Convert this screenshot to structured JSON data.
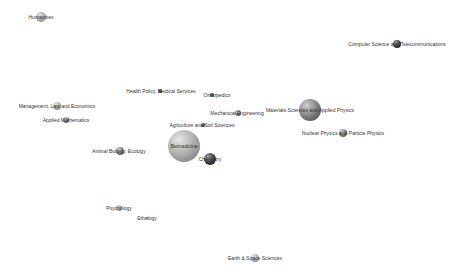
{
  "diagram": {
    "type": "bubble-network-map",
    "background": "#ffffff",
    "nodes": [
      {
        "id": "humanities",
        "label": "Humanities",
        "x": 41,
        "y": 17,
        "r": 5,
        "shade": "light",
        "label_x": 41,
        "label_y": 17
      },
      {
        "id": "computer-science",
        "label": "Computer Science and Telecommunications",
        "x": 397,
        "y": 44,
        "r": 4,
        "shade": "dark",
        "label_x": 397,
        "label_y": 44
      },
      {
        "id": "health-policy",
        "label": "Health Policy, Medical Services",
        "x": 160,
        "y": 91,
        "r": 2,
        "shade": "dark",
        "label_x": 161,
        "label_y": 91
      },
      {
        "id": "orthopedics",
        "label": "Orthopedics",
        "x": 212,
        "y": 95,
        "r": 2,
        "shade": "dark",
        "label_x": 217,
        "label_y": 95
      },
      {
        "id": "management",
        "label": "Management, Law and Economics",
        "x": 57,
        "y": 106,
        "r": 4,
        "shade": "light",
        "label_x": 57,
        "label_y": 106
      },
      {
        "id": "materials-sciences",
        "label": "Materials Sciences and Applied Physics",
        "x": 310,
        "y": 110,
        "r": 11,
        "shade": "mid",
        "label_x": 310,
        "label_y": 110
      },
      {
        "id": "mechanical-engineering",
        "label": "Mechanical Engineering",
        "x": 238,
        "y": 113,
        "r": 3,
        "shade": "mid",
        "label_x": 237,
        "label_y": 113
      },
      {
        "id": "applied-mathematics",
        "label": "Applied Mathematics",
        "x": 66,
        "y": 120,
        "r": 3,
        "shade": "mid",
        "label_x": 66,
        "label_y": 120
      },
      {
        "id": "agriculture",
        "label": "Agriculture and Soil Sciences",
        "x": 203,
        "y": 125,
        "r": 2,
        "shade": "dark",
        "label_x": 202,
        "label_y": 125
      },
      {
        "id": "nuclear-physics",
        "label": "Nuclear Physics and Particle Physics",
        "x": 343,
        "y": 133,
        "r": 4,
        "shade": "mid",
        "label_x": 343,
        "label_y": 133
      },
      {
        "id": "biomedicine",
        "label": "Biomedicine",
        "x": 184,
        "y": 146,
        "r": 16,
        "shade": "light",
        "label_x": 184,
        "label_y": 146
      },
      {
        "id": "animal-biology",
        "label": "Animal Biology, Ecology",
        "x": 120,
        "y": 151,
        "r": 4,
        "shade": "mid",
        "label_x": 119,
        "label_y": 151
      },
      {
        "id": "chemistry",
        "label": "Chemistry",
        "x": 210,
        "y": 159,
        "r": 6,
        "shade": "dark",
        "label_x": 210,
        "label_y": 159
      },
      {
        "id": "psychology",
        "label": "Psychology",
        "x": 119,
        "y": 208,
        "r": 3,
        "shade": "light",
        "label_x": 119,
        "label_y": 208
      },
      {
        "id": "ethology",
        "label": "Ethology",
        "x": 147,
        "y": 218,
        "r": 1,
        "shade": "mid",
        "label_x": 147,
        "label_y": 218
      },
      {
        "id": "earth-space",
        "label": "Earth & Space Sciences",
        "x": 255,
        "y": 258,
        "r": 4,
        "shade": "light",
        "label_x": 255,
        "label_y": 258
      }
    ],
    "shades": {
      "light": {
        "highlight": "#e6e6e6",
        "base": "#a8a8a8",
        "edge": "#6e6e6e"
      },
      "mid": {
        "highlight": "#cfcfcf",
        "base": "#7a7a7a",
        "edge": "#3f3f3f"
      },
      "dark": {
        "highlight": "#9a9a9a",
        "base": "#3a3a3a",
        "edge": "#111111"
      }
    },
    "label_color": "#333333"
  }
}
